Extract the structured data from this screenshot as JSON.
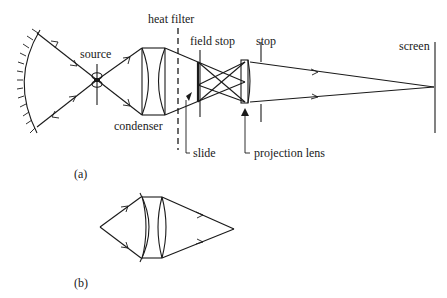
{
  "figure": {
    "part_a": {
      "caption": "(a)",
      "labels": {
        "source": "source",
        "heat_filter": "heat filter",
        "field_stop": "field stop",
        "stop": "stop",
        "screen": "screen",
        "condenser": "condenser",
        "slide": "slide",
        "projection_lens": "projection lens"
      },
      "components": [
        "concave-mirror",
        "source",
        "condenser",
        "heat-filter",
        "field-stop",
        "slide",
        "projection-lens",
        "stop",
        "screen"
      ]
    },
    "part_b": {
      "caption": "(b)",
      "components": [
        "meniscus-lens",
        "biconvex-lens"
      ]
    },
    "colors": {
      "ink": "#1a1a1a",
      "background": "#ffffff"
    }
  }
}
